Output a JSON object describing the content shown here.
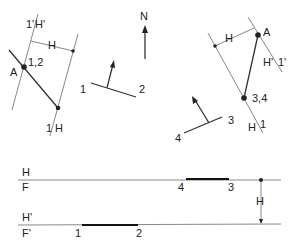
{
  "diagram": {
    "type": "descriptive-geometry",
    "north_label": "N",
    "left_view": {
      "fold_label_1": "1'",
      "fold_label_1b": "H'",
      "fold_label_2": "1",
      "fold_label_2b": "H",
      "distance_label": "H",
      "point_a_label": "A",
      "point_12_label": "1,2"
    },
    "center_symbol_1": {
      "label_1": "1",
      "label_2": "2"
    },
    "center_symbol_2": {
      "label_3": "3",
      "label_4": "4"
    },
    "right_view": {
      "distance_label": "H",
      "point_a_label": "A",
      "fold_label_1": "H'",
      "fold_label_1b": "1'",
      "point_34_label": "3,4",
      "fold_label_2": "H",
      "fold_label_2b": "1"
    },
    "bottom": {
      "line1_top": "H",
      "line1_bottom": "F",
      "line2_top": "H'",
      "line2_bottom": "F'",
      "seg_43_label_4": "4",
      "seg_43_label_3": "3",
      "seg_12_label_1": "1",
      "seg_12_label_2": "2",
      "dim_label": "H"
    }
  }
}
